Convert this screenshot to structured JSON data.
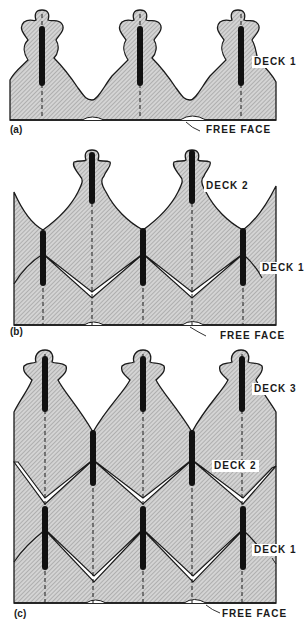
{
  "figure": {
    "panels": [
      {
        "id": "a",
        "tag": "(a)",
        "labels": {
          "deck1": "DECK 1",
          "free_face": "FREE FACE"
        }
      },
      {
        "id": "b",
        "tag": "(b)",
        "labels": {
          "deck2": "DECK 2",
          "deck1": "DECK 1",
          "free_face": "FREE FACE"
        }
      },
      {
        "id": "c",
        "tag": "(c)",
        "labels": {
          "deck3": "DECK 3",
          "deck2": "DECK 2",
          "deck1": "DECK 1",
          "free_face": "FREE FACE"
        }
      }
    ]
  },
  "colors": {
    "ink": "#1a1a1a",
    "hatch_fill": "#c9c9c9",
    "background": "#ffffff"
  }
}
